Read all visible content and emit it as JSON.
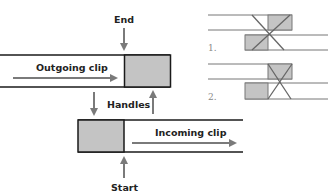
{
  "main_diagram": {
    "labels": {
      "end": "End",
      "start": "Start",
      "handles": "Handles",
      "outgoing": "Outgoing clip",
      "incoming": "Incoming clip"
    },
    "colors": {
      "line": "#1a1a1a",
      "arrow": "#7a7a7a",
      "handle_fill": "#c4c4c4"
    }
  },
  "side_diagrams": [
    {
      "label": "1.",
      "description": "Transition centered on cut, using both handles"
    },
    {
      "label": "2.",
      "description": "Transition starting at cut, using incoming handle only"
    }
  ]
}
